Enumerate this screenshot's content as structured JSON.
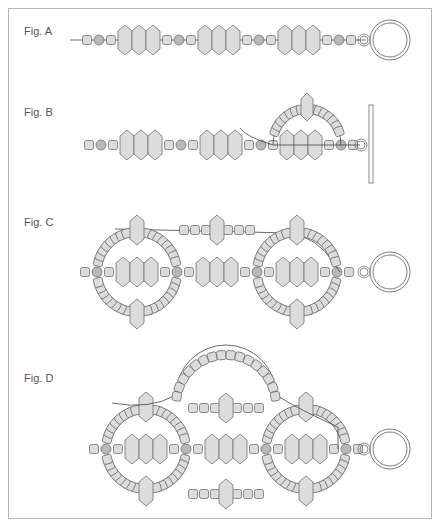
{
  "colors": {
    "bead_fill": "#dcdcdc",
    "round_fill": "#b9b9b9",
    "stroke": "#6e6e6e",
    "thread": "#444444",
    "frame": "#b5b5b5"
  },
  "figures": [
    {
      "label": "Fig. A",
      "label_pos": [
        24,
        32
      ]
    },
    {
      "label": "Fig. B",
      "label_pos": [
        24,
        113
      ]
    },
    {
      "label": "Fig. C",
      "label_pos": [
        24,
        223
      ]
    },
    {
      "label": "Fig. D",
      "label_pos": [
        24,
        379
      ]
    }
  ],
  "rows": [
    {
      "y": 40,
      "seq": "S R S D D D S R S D D D S R S D D D S R S",
      "x0": 82,
      "thread": [
        70,
        366
      ]
    },
    {
      "y": 145,
      "seq": "S R S D D D S R S D D D S R S D D D S R S",
      "x0": 84,
      "thread": null
    },
    {
      "y": 272,
      "seq": "S R S D D D S R S D D D S R S D D D S R S",
      "x0": 80,
      "thread": null
    },
    {
      "y": 449,
      "seq": "S R S D D D S R S D D D S R S D D D S R S",
      "x0": 89,
      "thread": null
    }
  ],
  "clasps": [
    {
      "type": "ring",
      "x": 364,
      "y": 40,
      "small_r": 6,
      "big_r": 20
    },
    {
      "type": "bar",
      "x": 369,
      "y1": 105,
      "y2": 183,
      "small_x": 361,
      "small_y": 145
    },
    {
      "type": "ring",
      "x": 364,
      "y": 272,
      "small_r": 6,
      "big_r": 20
    },
    {
      "type": "ring",
      "x": 364,
      "y": 449,
      "small_r": 6,
      "big_r": 20
    }
  ]
}
